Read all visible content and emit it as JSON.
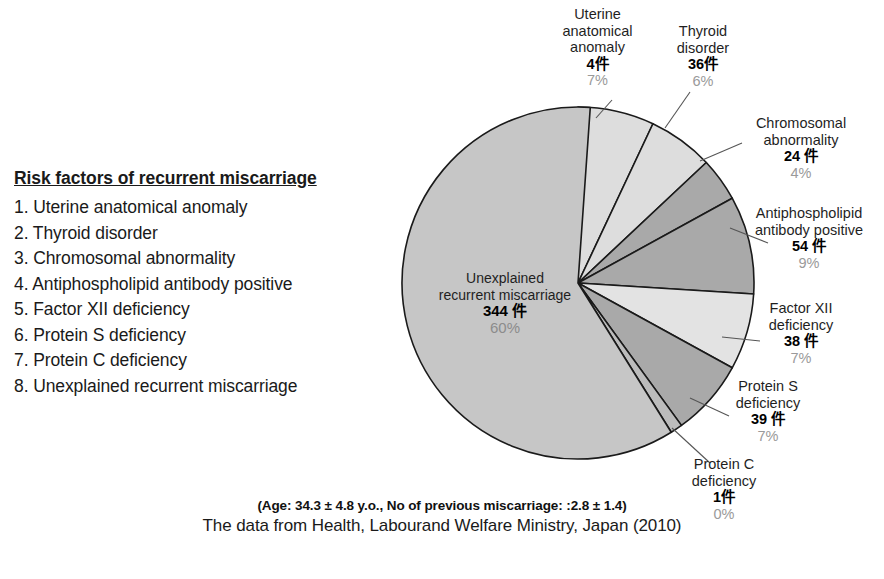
{
  "legend": {
    "title": "Risk factors of recurrent miscarriage",
    "items": [
      "1. Uterine anatomical anomaly",
      "2. Thyroid disorder",
      "3. Chromosomal abnormality",
      "4. Antiphospholipid antibody positive",
      "5. Factor XII deficiency",
      "6. Protein S deficiency",
      "7. Protein C deficiency",
      "8. Unexplained recurrent miscarriage"
    ]
  },
  "footer": {
    "note": "(Age: 34.3 ± 4.8 y.o., No of previous miscarriage: :2.8 ± 1.4)",
    "source": "The data from Health, Labourand Welfare Ministry, Japan (2010)"
  },
  "chart_data": {
    "type": "pie",
    "title": "Risk factors of recurrent miscarriage",
    "unit_suffix": "件",
    "start_angle_deg": 0,
    "direction": "clockwise",
    "legend_position": "left",
    "total_count": 580,
    "categories": [
      "Uterine anatomical anomaly",
      "Thyroid disorder",
      "Chromosomal abnormality",
      "Antiphospholipid antibody positive",
      "Factor XII deficiency",
      "Protein S deficiency",
      "Protein C deficiency",
      "Unexplained recurrent miscarriage"
    ],
    "values": [
      4,
      36,
      24,
      54,
      38,
      39,
      1,
      344
    ],
    "percents": [
      7,
      6,
      4,
      9,
      7,
      7,
      0,
      60
    ],
    "colors": [
      "#dddddd",
      "#dddddd",
      "#a9a9a9",
      "#a9a9a9",
      "#e3e3e3",
      "#a9a9a9",
      "#bcbcbc",
      "#c6c6c6"
    ],
    "slices": [
      {
        "label": "Uterine anatomical anomaly",
        "count": "4件",
        "percent": "7%",
        "color": "#dddddd",
        "sweep": 25.2
      },
      {
        "label": "Thyroid disorder",
        "count": "36件",
        "percent": "6%",
        "color": "#dddddd",
        "sweep": 21.6
      },
      {
        "label": "Chromosomal abnormality",
        "count": "24件",
        "percent": "4%",
        "color": "#a9a9a9",
        "sweep": 14.4
      },
      {
        "label": "Antiphospholipid antibody positive",
        "count": "54 件",
        "percent": "9%",
        "color": "#a9a9a9",
        "sweep": 32.4
      },
      {
        "label": "Factor XII deficiency",
        "count": "38 件",
        "percent": "7%",
        "color": "#e3e3e3",
        "sweep": 25.2
      },
      {
        "label": "Protein S deficiency",
        "count": "39 件",
        "percent": "7%",
        "color": "#a9a9a9",
        "sweep": 25.2
      },
      {
        "label": "Protein C deficiency",
        "count": "1件",
        "percent": "0%",
        "color": "#bcbcbc",
        "sweep": 4.0
      },
      {
        "label": "Unexplained recurrent miscarriage",
        "count": "344 件",
        "percent": "60%",
        "color": "#c6c6c6",
        "sweep": 216.0
      }
    ]
  },
  "callouts": {
    "uterine": {
      "line1": "Uterine",
      "line2": "anatomical",
      "line3": "anomaly",
      "count": "4件",
      "percent": "7%"
    },
    "thyroid": {
      "line1": "Thyroid",
      "line2": "disorder",
      "count": "36件",
      "percent": "6%"
    },
    "chromosomal": {
      "line1": "Chromosomal",
      "line2": "abnormality",
      "count": "24 件",
      "percent": "4%"
    },
    "antiphospholipid": {
      "line1": "Antiphospholipid",
      "line2": "antibody positive",
      "count": "54 件",
      "percent": "9%"
    },
    "factor12": {
      "line1": "Factor XII",
      "line2": "deficiency",
      "count": "38 件",
      "percent": "7%"
    },
    "proteinS": {
      "line1": "Protein S",
      "line2": "deficiency",
      "count": "39 件",
      "percent": "7%"
    },
    "proteinC": {
      "line1": "Protein C",
      "line2": "deficiency",
      "count": "1件",
      "percent": "0%"
    },
    "unexplained": {
      "line1": "Unexplained",
      "line2": "recurrent miscarriage",
      "count": "344 件",
      "percent": "60%"
    }
  }
}
